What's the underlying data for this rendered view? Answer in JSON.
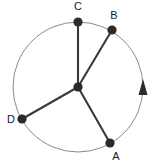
{
  "figure": {
    "type": "circle-with-radii-diagram",
    "background_color": "#ffffff",
    "stroke_color": "#3a3a3a",
    "circle_stroke_color": "#8a8a8a",
    "label_color": "#1a1a1a",
    "circle": {
      "center_x": 78,
      "center_y": 87,
      "radius": 65,
      "stroke_width": 1
    },
    "center_point": {
      "name": "center",
      "x": 78,
      "y": 87,
      "radius": 4.5
    },
    "points": [
      {
        "label": "A",
        "x": 110,
        "y": 143,
        "dot_radius": 4.5,
        "label_x": 116,
        "label_y": 157,
        "angle_deg": -60
      },
      {
        "label": "B",
        "x": 112,
        "y": 30,
        "dot_radius": 4.5,
        "label_x": 114,
        "label_y": 16,
        "angle_deg": 59
      },
      {
        "label": "C",
        "x": 78,
        "y": 22,
        "dot_radius": 4.5,
        "label_x": 78,
        "label_y": 7,
        "angle_deg": 90
      },
      {
        "label": "D",
        "x": 22,
        "y": 119,
        "dot_radius": 4.5,
        "label_x": 11,
        "label_y": 120,
        "angle_deg": 210
      }
    ],
    "radii": [
      {
        "name": "radius-to-a",
        "from": "center",
        "to": "A"
      },
      {
        "name": "radius-to-b",
        "from": "center",
        "to": "B"
      },
      {
        "name": "radius-to-c",
        "from": "center",
        "to": "C"
      },
      {
        "name": "radius-to-d",
        "from": "center",
        "to": "D"
      }
    ],
    "direction_arrow": {
      "name": "counterclockwise-direction-arrow",
      "tip_x": 143,
      "tip_y": 79,
      "base_y": 95,
      "half_width": 4,
      "points": "143,79 147,95 139,95",
      "fill": "#2b2b2b"
    }
  }
}
